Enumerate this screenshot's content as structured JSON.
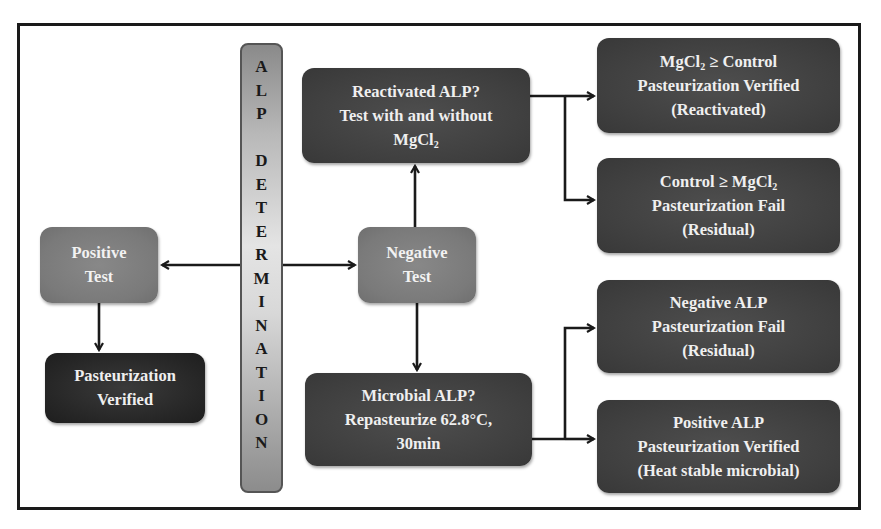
{
  "diagram": {
    "side_bar": {
      "label": "ALP DETERMINATION",
      "letters_line1": [
        "A",
        "L",
        "P"
      ],
      "letters_line2": [
        "D",
        "E",
        "T",
        "E",
        "R",
        "M",
        "I",
        "N",
        "A",
        "T",
        "I",
        "O",
        "N"
      ]
    },
    "positive_test": {
      "line1": "Positive",
      "line2": "Test"
    },
    "pasteurization_verified": {
      "line1": "Pasteurization",
      "line2": "Verified"
    },
    "negative_test": {
      "line1": "Negative",
      "line2": "Test"
    },
    "reactivated": {
      "line1": "Reactivated ALP?",
      "line2": "Test with and without",
      "line3_text": "MgCl",
      "line3_sub": "2"
    },
    "microbial": {
      "line1": "Microbial ALP?",
      "line2": "Repasteurize 62.8°C,",
      "line3": "30min"
    },
    "outcomes": [
      {
        "line1_pre": "MgCl",
        "line1_sub": "2",
        "line1_post": " ≥ Control",
        "line2": "Pasteurization Verified",
        "line3": "(Reactivated)"
      },
      {
        "line1_pre": "Control ≥ MgCl",
        "line1_sub": "2",
        "line1_post": "",
        "line2": "Pasteurization Fail",
        "line3": "(Residual)"
      },
      {
        "line1_pre": "Negative ALP",
        "line1_sub": "",
        "line1_post": "",
        "line2": "Pasteurization Fail",
        "line3": "(Residual)"
      },
      {
        "line1_pre": "Positive ALP",
        "line1_sub": "",
        "line1_post": "",
        "line2": "Pasteurization Verified",
        "line3": "(Heat stable microbial)"
      }
    ],
    "colors": {
      "dark_box": "#444444",
      "darker_box": "#262626",
      "mid_box": "#7d7d7d",
      "text": "#efefef",
      "line": "#1a1a1a"
    }
  }
}
